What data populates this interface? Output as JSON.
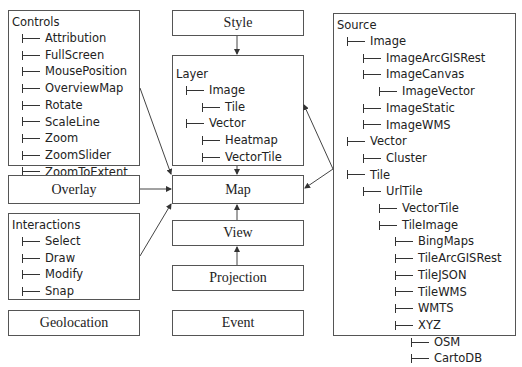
{
  "boxes": {
    "controls": {
      "title": "Controls",
      "items": [
        "Attribution",
        "FullScreen",
        "MousePosition",
        "OverviewMap",
        "Rotate",
        "ScaleLine",
        "Zoom",
        "ZoomSlider",
        "ZoomToExtent"
      ]
    },
    "overlay": {
      "label": "Overlay"
    },
    "interactions": {
      "title": "Interactions",
      "items": [
        "Select",
        "Draw",
        "Modify",
        "Snap"
      ]
    },
    "geolocation": {
      "label": "Geolocation"
    },
    "style": {
      "label": "Style"
    },
    "layer": {
      "title": "Layer",
      "items": [
        {
          "label": "Image",
          "depth": 1
        },
        {
          "label": "Tile",
          "depth": 2
        },
        {
          "label": "Vector",
          "depth": 1
        },
        {
          "label": "Heatmap",
          "depth": 2
        },
        {
          "label": "VectorTile",
          "depth": 2
        }
      ]
    },
    "map": {
      "label": "Map"
    },
    "view": {
      "label": "View"
    },
    "projection": {
      "label": "Projection"
    },
    "event": {
      "label": "Event"
    },
    "source": {
      "title": "Source",
      "items": [
        {
          "label": "Image",
          "depth": 1
        },
        {
          "label": "ImageArcGISRest",
          "depth": 2
        },
        {
          "label": "ImageCanvas",
          "depth": 2
        },
        {
          "label": "ImageVector",
          "depth": 3
        },
        {
          "label": "ImageStatic",
          "depth": 2
        },
        {
          "label": "ImageWMS",
          "depth": 2
        },
        {
          "label": "Vector",
          "depth": 1
        },
        {
          "label": "Cluster",
          "depth": 2
        },
        {
          "label": "Tile",
          "depth": 1
        },
        {
          "label": "UrlTile",
          "depth": 2
        },
        {
          "label": "VectorTile",
          "depth": 3
        },
        {
          "label": "TileImage",
          "depth": 3
        },
        {
          "label": "BingMaps",
          "depth": 4
        },
        {
          "label": "TileArcGISRest",
          "depth": 4
        },
        {
          "label": "TileJSON",
          "depth": 4
        },
        {
          "label": "TileWMS",
          "depth": 4
        },
        {
          "label": "WMTS",
          "depth": 4
        },
        {
          "label": "XYZ",
          "depth": 4
        },
        {
          "label": "OSM",
          "depth": 5
        },
        {
          "label": "CartoDB",
          "depth": 5
        }
      ]
    }
  },
  "edges": [
    {
      "from": "Style",
      "to": "Layer"
    },
    {
      "from": "Layer",
      "to": "Map"
    },
    {
      "from": "Controls",
      "to": "Map"
    },
    {
      "from": "Overlay",
      "to": "Map"
    },
    {
      "from": "Interactions",
      "to": "Map"
    },
    {
      "from": "View",
      "to": "Map"
    },
    {
      "from": "Projection",
      "to": "View"
    },
    {
      "from": "Source",
      "to": "Layer"
    },
    {
      "from": "Source",
      "to": "Map"
    }
  ]
}
